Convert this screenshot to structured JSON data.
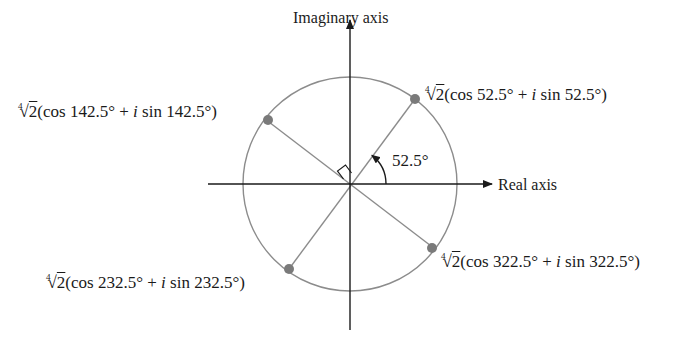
{
  "axes": {
    "vertical_label": "Imaginary axis",
    "horizontal_label": "Real axis"
  },
  "angle": {
    "label": "52.5°",
    "degrees": 52.5
  },
  "roots": [
    {
      "index": "4",
      "radicand": "2",
      "cos_text": "(cos 52.5° + ",
      "i": "i",
      "sin_text": " sin 52.5°)",
      "angle": 52.5
    },
    {
      "index": "4",
      "radicand": "2",
      "cos_text": "(cos 142.5° + ",
      "i": "i",
      "sin_text": " sin 142.5°)",
      "angle": 142.5
    },
    {
      "index": "4",
      "radicand": "2",
      "cos_text": "(cos 232.5° + ",
      "i": "i",
      "sin_text": " sin 232.5°)",
      "angle": 232.5
    },
    {
      "index": "4",
      "radicand": "2",
      "cos_text": "(cos 322.5° + ",
      "i": "i",
      "sin_text": " sin 322.5°)",
      "angle": 322.5
    }
  ],
  "colors": {
    "axis": "#1a1a1a",
    "circle": "#8c8c8c",
    "point": "#7a7a7a",
    "ray": "#8c8c8c"
  }
}
